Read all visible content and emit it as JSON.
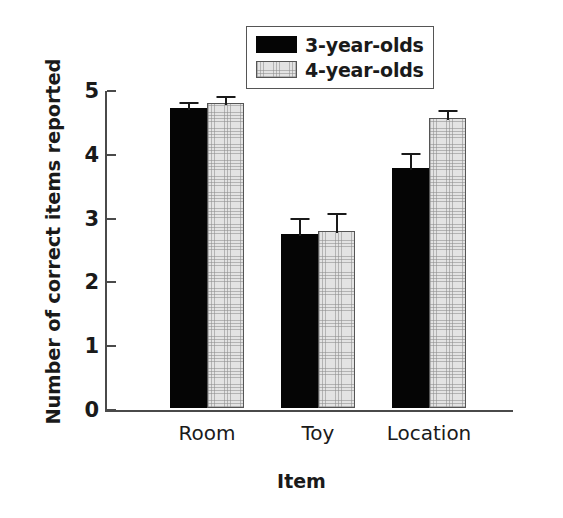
{
  "chart_data": {
    "type": "bar",
    "title": "",
    "xlabel": "Item",
    "ylabel": "Number of correct items reported",
    "categories": [
      "Room",
      "Toy",
      "Location"
    ],
    "ylim": [
      0,
      5
    ],
    "yticks": [
      0,
      1,
      2,
      3,
      4,
      5
    ],
    "ytick_labels": [
      "0",
      "1",
      "2",
      "3",
      "4",
      "5"
    ],
    "grid": false,
    "legend_position": "top-center",
    "series": [
      {
        "name": "3-year-olds",
        "color": "#050505",
        "values": [
          4.7,
          2.73,
          3.76
        ],
        "errors": [
          0.13,
          0.28,
          0.27
        ]
      },
      {
        "name": "4-year-olds",
        "color": "#e3e3e3",
        "values": [
          4.78,
          2.78,
          4.55
        ],
        "errors": [
          0.14,
          0.3,
          0.16
        ]
      }
    ]
  },
  "legend": {
    "items": [
      {
        "label": "3-year-olds",
        "swatch": "black-filled-swatch"
      },
      {
        "label": "4-year-olds",
        "swatch": "gray-hatched-swatch"
      }
    ]
  }
}
